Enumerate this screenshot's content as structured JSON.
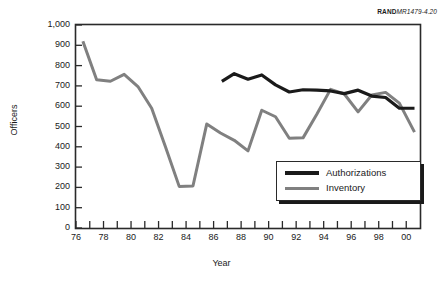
{
  "credit": {
    "prefix": "RAND",
    "code": "MR1479-4.20"
  },
  "chart_data": {
    "type": "line",
    "title": "",
    "xlabel": "Year",
    "ylabel": "Officers",
    "xlim": [
      1976,
      2001
    ],
    "ylim": [
      0,
      1000
    ],
    "ytick_step": 100,
    "grid": false,
    "legend_position": "lower-right",
    "x_tick_labels": [
      "76",
      "78",
      "80",
      "82",
      "84",
      "86",
      "88",
      "90",
      "92",
      "94",
      "96",
      "98",
      "00"
    ],
    "x_tick_values": [
      1976,
      1978,
      1980,
      1982,
      1984,
      1986,
      1988,
      1990,
      1992,
      1994,
      1996,
      1998,
      2000
    ],
    "y_tick_labels": [
      "0",
      "100",
      "200",
      "300",
      "400",
      "500",
      "600",
      "700",
      "800",
      "900",
      "1,000"
    ],
    "y_tick_values": [
      0,
      100,
      200,
      300,
      400,
      500,
      600,
      700,
      800,
      900,
      1000
    ],
    "series": [
      {
        "name": "Authorizations",
        "color": "#1a1a1a",
        "width": 3.2,
        "x": [
          1986.6,
          1987.5,
          1988.5,
          1989.5,
          1990.5,
          1991.5,
          1992.5,
          1993.5,
          1994.5,
          1995.5,
          1996.5,
          1997.5,
          1998.5,
          1999.5,
          2000.6
        ],
        "values": [
          722,
          760,
          733,
          754,
          705,
          670,
          681,
          679,
          675,
          662,
          679,
          650,
          643,
          590,
          590
        ]
      },
      {
        "name": "Inventory",
        "color": "#808080",
        "width": 3.0,
        "x": [
          1976.5,
          1977.5,
          1978.5,
          1979.5,
          1980.5,
          1981.5,
          1982.5,
          1983.5,
          1984.5,
          1485,
          1985.5,
          1986.5,
          1987.5,
          1988.5,
          1989.5,
          1990.5,
          1991.5,
          1992.5,
          1993.5,
          1994.5,
          1995.5,
          1996.5,
          1997.5,
          1998.5,
          1999.5,
          2000.6
        ],
        "values": [
          920,
          730,
          723,
          757,
          697,
          590,
          400,
          205,
          207,
          null,
          512,
          468,
          432,
          380,
          580,
          548,
          442,
          444,
          560,
          683,
          660,
          572,
          655,
          668,
          615,
          472
        ]
      }
    ],
    "legend": [
      {
        "label": "Authorizations",
        "color": "#1a1a1a"
      },
      {
        "label": "Inventory",
        "color": "#808080"
      }
    ]
  }
}
